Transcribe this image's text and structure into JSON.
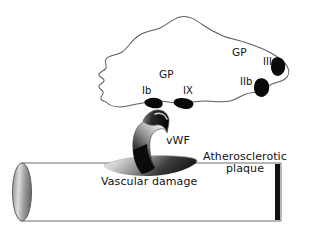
{
  "figure": {
    "type": "biological-schematic"
  },
  "labels": {
    "gp_left": "GP",
    "receptor_ib": "Ib",
    "receptor_ix": "IX",
    "gp_right": "GP",
    "receptor_iiia": "IIIa",
    "receptor_iib": "IIb",
    "vwf": "vWF",
    "plaque_line1": "Atherosclerotic",
    "plaque_line2": "plaque",
    "vascular_damage": "Vascular damage"
  },
  "structures": {
    "platelet": "platelet-membrane-outline",
    "vessel": "blood-vessel-cylinder",
    "plaque": "atherosclerotic-plaque-lens",
    "vwf_strand": "von-willebrand-factor-strand",
    "receptors": [
      {
        "name": "glycoprotein-ib",
        "label": "Ib"
      },
      {
        "name": "glycoprotein-ix",
        "label": "IX"
      },
      {
        "name": "glycoprotein-iib",
        "label": "IIb"
      },
      {
        "name": "glycoprotein-iiia",
        "label": "IIIa"
      }
    ]
  },
  "colors": {
    "background": "#ffffff",
    "outline": "#595959",
    "receptor_fill": "#0a0a0a",
    "text": "#121212",
    "vessel_stroke": "#6b6b6b",
    "vessel_cap_light": "#d7d7d7",
    "vessel_cap_dark": "#6e6e6e",
    "plaque_light": "#e8e8e8",
    "plaque_dark": "#1c1c1c",
    "vwf_light": "#efefef",
    "vwf_dark": "#0d0d0d",
    "plaque_edge": "#111111"
  }
}
